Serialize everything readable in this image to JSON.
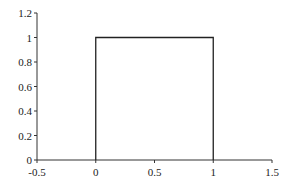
{
  "chart_data": {
    "type": "line",
    "title": "",
    "xlabel": "",
    "ylabel": "",
    "xlim": [
      -0.5,
      1.5
    ],
    "ylim": [
      0,
      1.2
    ],
    "grid": false,
    "legend": null,
    "x_ticks": [
      -0.5,
      0,
      0.5,
      1,
      1.5
    ],
    "x_tick_labels": [
      "-0.5",
      "0",
      "0.5",
      "1",
      "1.5"
    ],
    "y_ticks": [
      0,
      0.2,
      0.4,
      0.6,
      0.8,
      1,
      1.2
    ],
    "y_tick_labels": [
      "0",
      "0.2",
      "0.4",
      "0.6",
      "0.8",
      "1",
      "1.2"
    ],
    "series": [
      {
        "name": "rectangular pulse",
        "x": [
          0,
          0,
          1,
          1
        ],
        "y": [
          0,
          1,
          1,
          0
        ],
        "color": "#222222"
      }
    ]
  }
}
